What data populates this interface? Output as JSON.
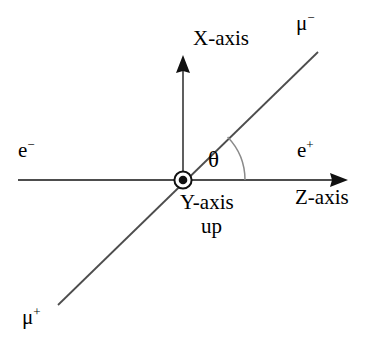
{
  "figure": {
    "kind": "physics-vector-diagram",
    "width": 381,
    "height": 352,
    "background_color": "#ffffff",
    "line_color": "#4d4d4d",
    "text_color": "#000000"
  },
  "labels": {
    "x_axis": "X-axis",
    "z_axis": "Z-axis",
    "y_axis": "Y-axis",
    "y_axis_direction": "up",
    "electron": "e",
    "electron_charge": "−",
    "positron": "e",
    "positron_charge": "+",
    "muon_minus": "μ",
    "muon_minus_charge": "−",
    "muon_plus": "μ",
    "muon_plus_charge": "+",
    "theta": "θ"
  },
  "geometry": {
    "origin": {
      "x": 183,
      "y": 180
    },
    "z_axis_line": {
      "x1": 18,
      "y1": 180,
      "x2": 348,
      "y2": 180
    },
    "z_axis_arrow_tip": {
      "x": 348,
      "y": 180
    },
    "x_axis_line": {
      "x1": 183,
      "y1": 180,
      "x2": 183,
      "y2": 55
    },
    "x_axis_arrow_tip": {
      "x": 183,
      "y": 55
    },
    "muon_line": {
      "x1": 58,
      "y1": 305,
      "x2": 318,
      "y2": 52
    },
    "muon_angle_degrees": 44,
    "theta_arc_radius": 62,
    "origin_marker": {
      "outer_radius": 9,
      "inner_radius": 4.2
    }
  },
  "label_positions": {
    "x_axis": {
      "x": 193,
      "y": 28
    },
    "z_axis": {
      "x": 295,
      "y": 187
    },
    "y_axis": {
      "x": 180,
      "y": 192
    },
    "y_axis_direction": {
      "x": 200,
      "y": 216
    },
    "electron": {
      "x": 18,
      "y": 140
    },
    "positron": {
      "x": 297,
      "y": 140
    },
    "muon_minus": {
      "x": 296,
      "y": 13
    },
    "muon_plus": {
      "x": 22,
      "y": 307
    },
    "theta": {
      "x": 208,
      "y": 148
    }
  }
}
